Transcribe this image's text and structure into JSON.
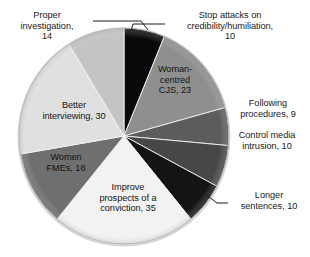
{
  "chart_data": {
    "type": "pie",
    "title": "",
    "subtitle": "",
    "xlabel": "",
    "ylabel": "",
    "legend_position": "none",
    "grid": false,
    "total": 159,
    "start_angle_deg": 0,
    "direction": "clockwise",
    "categories": [
      "Stop attacks on credibility/humiliation",
      "Woman-centred CJS",
      "Following procedures",
      "Control media intrusion",
      "Longer sentences",
      "Improve prospects of a conviction",
      "Women FMEs",
      "Better interviewing",
      "Proper investigation"
    ],
    "values": [
      10,
      23,
      9,
      10,
      10,
      35,
      18,
      30,
      14
    ],
    "colors": [
      "#0a0a0a",
      "#8f8f8f",
      "#5c5c5c",
      "#474747",
      "#141414",
      "#f2f2f2",
      "#6f6f6f",
      "#e0e0e0",
      "#c4c4c4"
    ],
    "slices": [
      {
        "name": "Stop attacks on credibility/humiliation",
        "value": 10,
        "color": "#0a0a0a",
        "label_placement": "outside",
        "start_deg": 0.0,
        "end_deg": 22.64
      },
      {
        "name": "Woman-centred CJS",
        "value": 23,
        "color": "#8f8f8f",
        "label_placement": "inside",
        "start_deg": 22.64,
        "end_deg": 74.72
      },
      {
        "name": "Following procedures",
        "value": 9,
        "color": "#5c5c5c",
        "label_placement": "outside",
        "start_deg": 74.72,
        "end_deg": 95.09
      },
      {
        "name": "Control media intrusion",
        "value": 10,
        "color": "#474747",
        "label_placement": "outside",
        "start_deg": 95.09,
        "end_deg": 117.74
      },
      {
        "name": "Longer sentences",
        "value": 10,
        "color": "#141414",
        "label_placement": "outside",
        "start_deg": 117.74,
        "end_deg": 140.38
      },
      {
        "name": "Improve prospects of a conviction",
        "value": 35,
        "color": "#f2f2f2",
        "label_placement": "inside",
        "start_deg": 140.38,
        "end_deg": 219.62
      },
      {
        "name": "Women FMEs",
        "value": 18,
        "color": "#6f6f6f",
        "label_placement": "inside",
        "start_deg": 219.62,
        "end_deg": 260.38
      },
      {
        "name": "Better interviewing",
        "value": 30,
        "color": "#e0e0e0",
        "label_placement": "inside",
        "start_deg": 260.38,
        "end_deg": 328.3
      },
      {
        "name": "Proper investigation",
        "value": 14,
        "color": "#c4c4c4",
        "label_placement": "outside",
        "start_deg": 328.3,
        "end_deg": 360.0
      }
    ]
  },
  "labels": {
    "proper_investigation": "Proper\ninvestigation,\n14",
    "stop_attacks": "Stop attacks on\ncredibility/humiliation,\n10",
    "woman_centred": "Woman-\ncentred\nCJS, 23",
    "following_procedures": "Following\nprocedures, 9",
    "control_media": "Control media\nintrusion, 10",
    "longer_sentences": "Longer\nsentences, 10",
    "improve_prospects": "Improve\nprospects of a\nconviction, 35",
    "women_fmes": "Women\nFMEs, 18",
    "better_interviewing": "Better\ninterviewing, 30"
  }
}
